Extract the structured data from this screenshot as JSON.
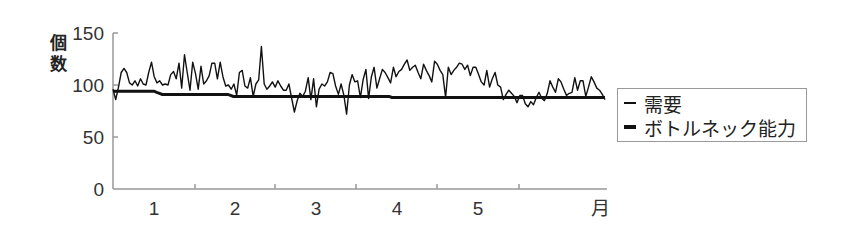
{
  "chart_data": {
    "type": "line",
    "title": "",
    "ylabel": "個数",
    "xlabel": "月",
    "ylim": [
      0,
      150
    ],
    "yticks": [
      0,
      50,
      100,
      150
    ],
    "xtick_labels": [
      "1",
      "2",
      "3",
      "4",
      "5",
      "月"
    ],
    "grid": false,
    "legend_position": "right",
    "series": [
      {
        "name": "需要",
        "style": "thin",
        "values": [
          96,
          86,
          98,
          112,
          116,
          112,
          102,
          100,
          104,
          99,
          106,
          101,
          100,
          112,
          122,
          108,
          102,
          104,
          100,
          101,
          100,
          110,
          113,
          106,
          121,
          97,
          129,
          112,
          95,
          122,
          111,
          96,
          118,
          101,
          104,
          109,
          121,
          121,
          106,
          122,
          108,
          99,
          100,
          96,
          101,
          90,
          112,
          114,
          99,
          97,
          107,
          89,
          101,
          105,
          137,
          101,
          96,
          99,
          103,
          98,
          104,
          99,
          95,
          95,
          101,
          87,
          74,
          85,
          92,
          89,
          94,
          107,
          86,
          106,
          79,
          96,
          101,
          99,
          103,
          112,
          111,
          99,
          91,
          101,
          90,
          72,
          100,
          110,
          103,
          104,
          88,
          105,
          115,
          87,
          108,
          117,
          97,
          106,
          115,
          112,
          107,
          102,
          117,
          108,
          113,
          115,
          120,
          124,
          114,
          117,
          119,
          112,
          106,
          120,
          114,
          109,
          103,
          123,
          120,
          114,
          110,
          88,
          117,
          110,
          114,
          117,
          121,
          120,
          115,
          119,
          109,
          117,
          117,
          110,
          103,
          100,
          114,
          98,
          106,
          112,
          100,
          98,
          86,
          91,
          95,
          92,
          89,
          83,
          90,
          90,
          82,
          79,
          84,
          81,
          88,
          93,
          87,
          85,
          92,
          104,
          98,
          93,
          106,
          103,
          96,
          90,
          92,
          93,
          107,
          95,
          104,
          104,
          89,
          98,
          108,
          103,
          97,
          95,
          91,
          86
        ]
      },
      {
        "name": "ボトルネック能力",
        "style": "thick",
        "values": [
          94,
          94,
          94,
          94,
          94,
          94,
          94,
          94,
          94,
          94,
          94,
          94,
          94,
          94,
          94,
          94,
          93,
          92,
          91,
          91,
          91,
          91,
          91,
          91,
          91,
          91,
          91,
          91,
          91,
          91,
          91,
          91,
          91,
          91,
          91,
          91,
          91,
          91,
          91,
          91,
          91,
          91,
          91,
          90,
          89,
          89,
          89,
          89,
          89,
          89,
          89,
          89,
          89,
          89,
          89,
          89,
          89,
          89,
          89,
          89,
          89,
          89,
          89,
          89,
          89,
          89,
          89,
          89,
          89,
          89,
          89,
          89,
          89,
          89,
          89,
          89,
          89,
          89,
          89,
          89,
          89,
          89,
          89,
          89,
          89,
          89,
          89,
          89,
          89,
          89,
          89,
          89,
          89,
          89,
          89,
          89,
          89,
          89,
          89,
          89,
          89,
          89,
          88,
          88,
          88,
          88,
          88,
          88,
          88,
          88,
          88,
          88,
          88,
          88,
          88,
          88,
          88,
          88,
          88,
          88,
          88,
          88,
          88,
          88,
          88,
          88,
          88,
          88,
          88,
          88,
          88,
          88,
          88,
          88,
          88,
          88,
          88,
          88,
          88,
          88,
          88,
          88,
          88,
          88,
          88,
          88,
          88,
          88,
          88,
          88,
          88,
          88,
          88,
          88,
          88,
          88,
          88,
          88,
          88,
          88,
          88,
          88,
          88,
          88,
          88,
          88,
          88,
          88,
          88,
          88,
          88,
          88,
          88,
          88,
          88,
          88,
          88,
          88,
          88,
          88,
          88
        ]
      }
    ]
  },
  "axis": {
    "ylabel_chars": [
      "個",
      "数"
    ],
    "yticks": [
      "0",
      "50",
      "100",
      "150"
    ],
    "xticks": [
      "1",
      "2",
      "3",
      "4",
      "5"
    ],
    "x_unit": "月"
  },
  "legend": {
    "items": [
      {
        "label": "需要"
      },
      {
        "label": "ボトルネック能力"
      }
    ]
  }
}
